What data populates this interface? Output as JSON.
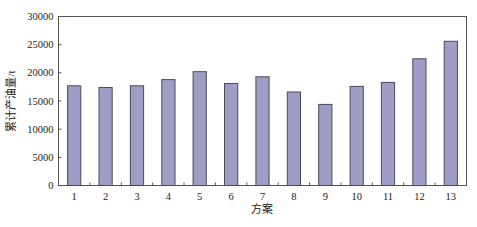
{
  "chart_data": {
    "type": "bar",
    "title": "",
    "xlabel": "方案",
    "ylabel": "累计产油量/t",
    "categories": [
      "1",
      "2",
      "3",
      "4",
      "5",
      "6",
      "7",
      "8",
      "9",
      "10",
      "11",
      "12",
      "13"
    ],
    "values": [
      17700,
      17400,
      17700,
      18800,
      20200,
      18100,
      19300,
      16600,
      14400,
      17600,
      18300,
      22500,
      25600
    ],
    "ylim": [
      0,
      30000
    ],
    "yticks": [
      0,
      5000,
      10000,
      15000,
      20000,
      25000,
      30000
    ],
    "grid": false,
    "legend": null,
    "bar_color": "#9f9cc6",
    "bar_edge_color": "#4a4a5a"
  }
}
